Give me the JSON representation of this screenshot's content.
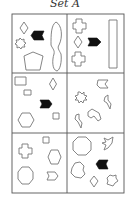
{
  "title": "Set A",
  "colors": {
    "grid": "#555555",
    "outline": "#777777",
    "filled": "#111111",
    "background": "#ffffff"
  },
  "grid": {
    "rows": 3,
    "cols": 2
  },
  "cells": [
    {
      "row": 1,
      "col": 1,
      "shapes": [
        "diamond",
        "black-chevron-arrow",
        "starburst",
        "pentagon",
        "tall-wavy-oval"
      ]
    },
    {
      "row": 1,
      "col": 2,
      "shapes": [
        "cross",
        "diamond",
        "black-chevron-arrow",
        "cross",
        "tall-rectangle"
      ]
    },
    {
      "row": 2,
      "col": 1,
      "shapes": [
        "rectangle",
        "diamond",
        "small-rectangle",
        "black-chevron-arrow",
        "hexagon",
        "small-square"
      ]
    },
    {
      "row": 2,
      "col": 2,
      "shapes": [
        "flag-pentagon",
        "starburst",
        "lightning-bolt",
        "lightning-bolt",
        "bent-arrow"
      ]
    },
    {
      "row": 3,
      "col": 1,
      "shapes": [
        "small-square",
        "cross",
        "hexagon",
        "octagon",
        "notched-pentagon"
      ]
    },
    {
      "row": 3,
      "col": 2,
      "shapes": [
        "octagon",
        "bird-arrow",
        "blob",
        "black-chevron-arrow",
        "diamond",
        "starburst"
      ]
    }
  ]
}
